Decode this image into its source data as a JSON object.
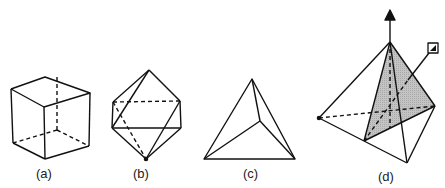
{
  "figure": {
    "panels": [
      {
        "id": "a",
        "label": "(a)",
        "shape": "cube"
      },
      {
        "id": "b",
        "label": "(b)",
        "shape": "octahedron"
      },
      {
        "id": "c",
        "label": "(c)",
        "shape": "tetrahedron"
      },
      {
        "id": "d",
        "label": "(d)",
        "shape": "tetrahedron with symmetry axes and shaded mirror plane"
      }
    ],
    "colors": {
      "line": "#111111",
      "shade": "#bdbdbd",
      "background": "#ffffff"
    }
  }
}
